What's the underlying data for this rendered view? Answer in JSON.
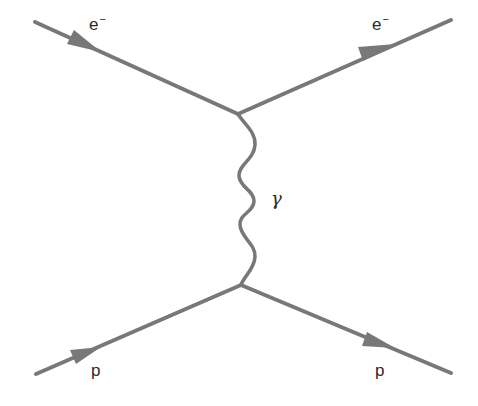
{
  "diagram": {
    "type": "feynman",
    "line_color": "#787878",
    "label_color": "#2a2a2a",
    "particles": [
      {
        "id": "e_in",
        "label": "e",
        "charge": "−",
        "role": "incoming electron"
      },
      {
        "id": "e_out",
        "label": "e",
        "charge": "−",
        "role": "outgoing electron"
      },
      {
        "id": "p_in",
        "label": "p",
        "role": "incoming proton"
      },
      {
        "id": "p_out",
        "label": "p",
        "role": "outgoing proton"
      }
    ],
    "propagator": {
      "label": "γ",
      "role": "virtual photon"
    }
  }
}
